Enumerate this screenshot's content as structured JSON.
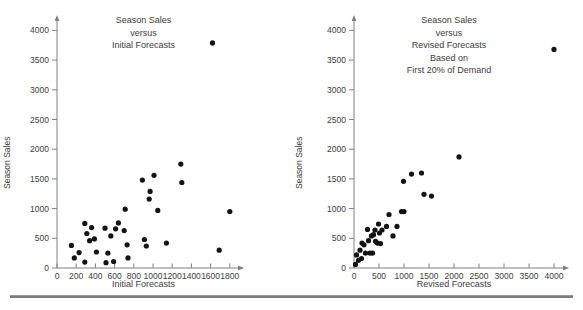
{
  "page": {
    "background": "#ffffff",
    "rule_color": "#7d7d7d",
    "dot_color": "#141414",
    "axis_color": "#808080",
    "text_color": "#3d3d3d"
  },
  "chart_data": [
    {
      "type": "scatter",
      "title": "Season Sales\nversus\nInitial Forecasts",
      "xlabel": "Initial Forecasts",
      "ylabel": "Season Sales",
      "xlim": [
        0,
        1800
      ],
      "ylim": [
        0,
        4000
      ],
      "xticks": [
        0,
        200,
        400,
        600,
        800,
        1000,
        1200,
        1400,
        1600,
        1800
      ],
      "yticks": [
        0,
        500,
        1000,
        1500,
        2000,
        2500,
        3000,
        3500,
        4000
      ],
      "grid": false,
      "legend": null,
      "points": [
        [
          150,
          380
        ],
        [
          180,
          170
        ],
        [
          230,
          260
        ],
        [
          290,
          100
        ],
        [
          290,
          750
        ],
        [
          310,
          580
        ],
        [
          340,
          460
        ],
        [
          360,
          680
        ],
        [
          390,
          490
        ],
        [
          410,
          270
        ],
        [
          500,
          670
        ],
        [
          510,
          90
        ],
        [
          530,
          250
        ],
        [
          560,
          540
        ],
        [
          590,
          110
        ],
        [
          610,
          660
        ],
        [
          640,
          760
        ],
        [
          700,
          630
        ],
        [
          710,
          990
        ],
        [
          730,
          390
        ],
        [
          740,
          170
        ],
        [
          890,
          1480
        ],
        [
          910,
          480
        ],
        [
          930,
          370
        ],
        [
          960,
          1160
        ],
        [
          970,
          1290
        ],
        [
          1010,
          1560
        ],
        [
          1050,
          970
        ],
        [
          1140,
          420
        ],
        [
          1290,
          1750
        ],
        [
          1300,
          1440
        ],
        [
          1620,
          3790
        ],
        [
          1690,
          300
        ],
        [
          1800,
          950
        ]
      ]
    },
    {
      "type": "scatter",
      "title": "Season Sales\nversus\nRevised Forecasts\nBased on\nFirst 20% of Demand",
      "xlabel": "Revised Forecasts",
      "ylabel": "Season Sales",
      "xlim": [
        0,
        4000
      ],
      "ylim": [
        0,
        4000
      ],
      "xticks": [
        0,
        500,
        1000,
        1500,
        2000,
        2500,
        3000,
        3500,
        4000
      ],
      "yticks": [
        0,
        500,
        1000,
        1500,
        2000,
        2500,
        3000,
        3500,
        4000
      ],
      "grid": false,
      "legend": null,
      "points": [
        [
          30,
          60
        ],
        [
          50,
          220
        ],
        [
          90,
          130
        ],
        [
          120,
          300
        ],
        [
          150,
          160
        ],
        [
          160,
          420
        ],
        [
          200,
          390
        ],
        [
          230,
          250
        ],
        [
          270,
          650
        ],
        [
          290,
          460
        ],
        [
          320,
          250
        ],
        [
          350,
          540
        ],
        [
          370,
          250
        ],
        [
          390,
          560
        ],
        [
          420,
          640
        ],
        [
          430,
          450
        ],
        [
          470,
          420
        ],
        [
          490,
          740
        ],
        [
          510,
          590
        ],
        [
          530,
          410
        ],
        [
          560,
          640
        ],
        [
          650,
          700
        ],
        [
          700,
          900
        ],
        [
          780,
          540
        ],
        [
          860,
          700
        ],
        [
          950,
          950
        ],
        [
          990,
          1460
        ],
        [
          1000,
          950
        ],
        [
          1150,
          1580
        ],
        [
          1350,
          1600
        ],
        [
          1400,
          1240
        ],
        [
          1550,
          1210
        ],
        [
          2100,
          1870
        ],
        [
          4000,
          3680
        ]
      ]
    }
  ]
}
